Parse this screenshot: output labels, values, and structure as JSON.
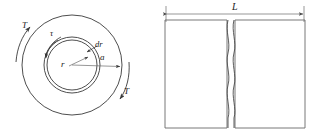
{
  "figure": {
    "type": "engineering-diagram",
    "background_color": "#ffffff",
    "line_color": "#3a3a3a",
    "text_color": "#1a1a1a"
  },
  "cross_section": {
    "name": "shaft-cross-section",
    "center": {
      "x": 72,
      "y": 65
    },
    "circles": [
      {
        "name": "outer-radius-circle",
        "radius": 50,
        "meaning": "outer surface radius a"
      },
      {
        "name": "element-outer-circle",
        "radius": 28,
        "meaning": "radius r plus dr"
      },
      {
        "name": "element-inner-circle",
        "radius": 25,
        "meaning": "radius r"
      }
    ],
    "labels": {
      "torque_upper": "T",
      "torque_lower": "T",
      "shear_stress": "τ",
      "radius": "r",
      "thickness": "dr",
      "outer_radius": "a"
    },
    "label_positions": {
      "torque_upper": {
        "x": 22,
        "y": 21
      },
      "torque_lower": {
        "x": 124,
        "y": 87
      },
      "shear_stress": {
        "x": 50,
        "y": 29
      },
      "radius": {
        "x": 61,
        "y": 60
      },
      "thickness": {
        "x": 95,
        "y": 45
      },
      "outer_radius": {
        "x": 100,
        "y": 57
      }
    },
    "arrows": {
      "torque_upper": {
        "name": "torque-arc-upper-left",
        "direction": "counterclockwise"
      },
      "torque_lower": {
        "name": "torque-arc-lower-right",
        "direction": "counterclockwise"
      },
      "shear_stress": {
        "name": "shear-stress-arc-arrow",
        "direction": "counterclockwise"
      },
      "radius": {
        "name": "radius-dimension-arrow",
        "direction": "outward"
      },
      "thickness": {
        "name": "dr-leader-arrow",
        "direction": "inward"
      },
      "outer_radius": {
        "name": "outer-radius-dimension-arrow",
        "direction": "outward"
      }
    }
  },
  "side_view": {
    "name": "shaft-side-elevation",
    "rectangle": {
      "x": 165,
      "y": 20,
      "width": 140,
      "height": 108
    },
    "break_line": {
      "name": "wavy-break-line",
      "x": 229,
      "gap": 6
    },
    "dimension": {
      "label": "L",
      "label_position": {
        "x": 232,
        "y": 4
      },
      "line_y": 14,
      "from_x": 166,
      "to_x": 304
    }
  }
}
